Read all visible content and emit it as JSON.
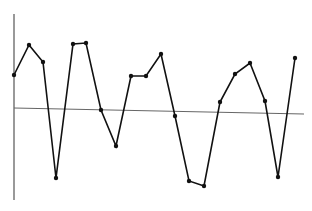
{
  "chart_data": {
    "type": "line",
    "title": "",
    "xlabel": "",
    "ylabel": "",
    "grid": false,
    "legend": null,
    "x": [
      1,
      2,
      3,
      4,
      5,
      6,
      7,
      8,
      9,
      10,
      11,
      12,
      13,
      14,
      15,
      16,
      17,
      18,
      19,
      20
    ],
    "values": [
      33,
      63,
      46,
      -69,
      65,
      66,
      -1,
      -36,
      33,
      33,
      55,
      -5,
      -70,
      -75,
      9,
      37,
      48,
      11,
      -64,
      55
    ],
    "ylim": [
      -100,
      100
    ],
    "baseline": 0,
    "colors": {
      "line": "#111111",
      "marker": "#111111",
      "axis": "#555555",
      "baseline": "#666666",
      "background": "#ffffff"
    },
    "pixel_points": [
      [
        14,
        75
      ],
      [
        29,
        45
      ],
      [
        43,
        62
      ],
      [
        56,
        178
      ],
      [
        73,
        44
      ],
      [
        86,
        43
      ],
      [
        101,
        110
      ],
      [
        116,
        146
      ],
      [
        131,
        76
      ],
      [
        146,
        76
      ],
      [
        161,
        54
      ],
      [
        175,
        116
      ],
      [
        189,
        181
      ],
      [
        204,
        186
      ],
      [
        220,
        102
      ],
      [
        235,
        74
      ],
      [
        250,
        63
      ],
      [
        265,
        101
      ],
      [
        278,
        177
      ],
      [
        295,
        58
      ]
    ],
    "axis": {
      "x": 14,
      "y_top": 14,
      "y_bottom": 200
    },
    "baseline_line": {
      "x1": 14,
      "y1": 108,
      "x2": 304,
      "y2": 114
    }
  }
}
